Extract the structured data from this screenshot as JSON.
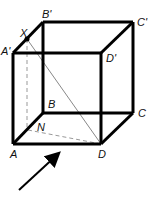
{
  "diagram": {
    "type": "cube-perspective",
    "vertices": {
      "A": {
        "label": "A",
        "x": 13,
        "y": 144
      },
      "B": {
        "label": "B",
        "x": 43,
        "y": 113
      },
      "C": {
        "label": "C",
        "x": 133,
        "y": 113
      },
      "D": {
        "label": "D",
        "x": 101,
        "y": 144
      },
      "A1": {
        "label": "A'",
        "x": 13,
        "y": 53
      },
      "B1": {
        "label": "B'",
        "x": 43,
        "y": 22
      },
      "C1": {
        "label": "C'",
        "x": 133,
        "y": 22
      },
      "D1": {
        "label": "D'",
        "x": 101,
        "y": 53
      }
    },
    "points": {
      "X": {
        "label": "X",
        "x": 27,
        "y": 39
      },
      "N": {
        "label": "N",
        "x": 28,
        "y": 130
      }
    },
    "arrow": {
      "from": [
        19,
        190
      ],
      "to": [
        62,
        150
      ]
    },
    "colors": {
      "edge": "#000000",
      "thin": "#888888",
      "dashed": "#999999"
    }
  }
}
